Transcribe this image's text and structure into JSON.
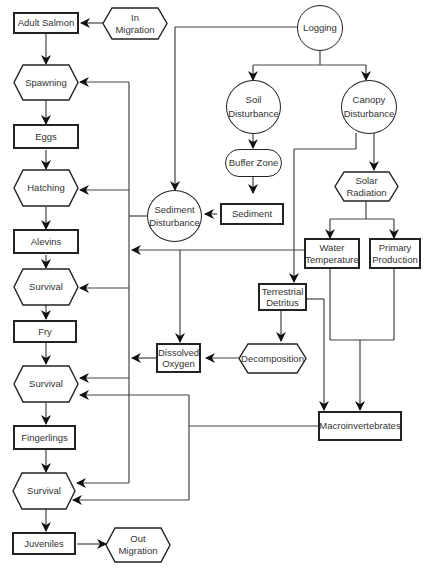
{
  "diagram": {
    "nodes": {
      "adult_salmon": "Adult Salmon",
      "in_migration": "In\nMigration",
      "spawning": "Spawning",
      "eggs": "Eggs",
      "hatching": "Hatching",
      "alevins": "Alevins",
      "survival_1": "Survival",
      "fry": "Fry",
      "survival_2": "Survival",
      "fingerlings": "Fingerlings",
      "survival_3": "Survival",
      "juveniles": "Juveniles",
      "out_migration": "Out\nMigration",
      "logging": "Logging",
      "soil_disturbance": "Soil\nDisturbance",
      "canopy_disturbance": "Canopy\nDisturbance",
      "buffer_zone": "Buffer Zone",
      "sediment": "Sediment",
      "sediment_disturbance": "Sediment\nDisturbance",
      "solar_radiation": "Solar\nRadiation",
      "water_temperature": "Water\nTemperature",
      "primary_production": "Primary\nProduction",
      "terrestrial_detritus": "Terrestrial\nDetritus",
      "decomposition": "Decomposition",
      "dissolved_oxygen": "Dissolved\nOxygen",
      "macroinvertebrates": "Macroinvertebrates"
    },
    "colors": {
      "stroke": "#222222",
      "text": "#333333",
      "background": "#ffffff"
    }
  }
}
